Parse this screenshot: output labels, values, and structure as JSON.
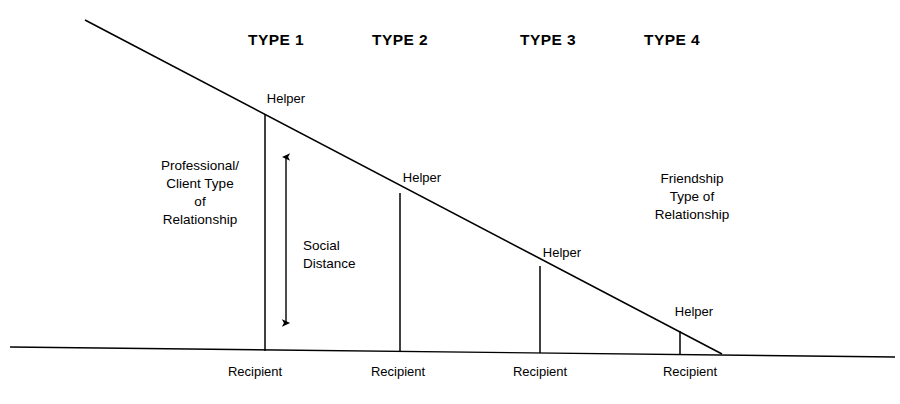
{
  "figure": {
    "background_color": "#ffffff",
    "line_color": "#000000"
  },
  "type_headers": [
    {
      "label": "TYPE 1",
      "x": 276,
      "y": 30
    },
    {
      "label": "TYPE 2",
      "x": 400,
      "y": 30
    },
    {
      "label": "TYPE 3",
      "x": 548,
      "y": 30
    },
    {
      "label": "TYPE 4",
      "x": 672,
      "y": 30
    }
  ],
  "helper_labels": [
    {
      "label": "Helper",
      "x": 286,
      "y": 91
    },
    {
      "label": "Helper",
      "x": 422,
      "y": 170
    },
    {
      "label": "Helper",
      "x": 562,
      "y": 245
    },
    {
      "label": "Helper",
      "x": 694,
      "y": 304
    }
  ],
  "recipient_labels": [
    {
      "label": "Recipient",
      "x": 255,
      "y": 364
    },
    {
      "label": "Recipient",
      "x": 398,
      "y": 364
    },
    {
      "label": "Recipient",
      "x": 540,
      "y": 364
    },
    {
      "label": "Recipient",
      "x": 690,
      "y": 364
    }
  ],
  "annotations": {
    "left_block": {
      "lines": [
        "Professional/",
        "Client Type",
        "of",
        "Relationship"
      ],
      "x": 200,
      "y": 157
    },
    "right_block": {
      "lines": [
        "Friendship",
        "Type of",
        "Relationship"
      ],
      "x": 692,
      "y": 170
    },
    "social_distance": {
      "lines": [
        "Social",
        "Distance"
      ],
      "x": 303,
      "y": 237
    }
  },
  "chart_data": {
    "type": "diagram",
    "xlabel": "",
    "ylabel": "Social Distance",
    "categories": [
      "TYPE 1",
      "TYPE 2",
      "TYPE 3",
      "TYPE 4"
    ],
    "series": [
      {
        "name": "Social Distance (vertical gap, px)",
        "values": [
          237,
          158,
          87,
          24
        ]
      }
    ],
    "geometry": {
      "helper_line": {
        "x1": 85,
        "y1": 20,
        "x2": 722,
        "y2": 354
      },
      "recipient_line": {
        "x1": 10,
        "y1": 347,
        "x2": 895,
        "y2": 357
      },
      "connectors": [
        {
          "type": "TYPE 1",
          "x": 265,
          "helper_y": 114,
          "recipient_y": 351
        },
        {
          "type": "TYPE 2",
          "x": 400,
          "helper_y": 193,
          "recipient_y": 351
        },
        {
          "type": "TYPE 3",
          "x": 540,
          "helper_y": 266,
          "recipient_y": 353
        },
        {
          "type": "TYPE 4",
          "x": 680,
          "helper_y": 331,
          "recipient_y": 355
        }
      ],
      "social_distance_arrow": {
        "x": 286,
        "y_top": 157,
        "y_bottom": 323
      }
    },
    "legend": [],
    "grid": false
  }
}
